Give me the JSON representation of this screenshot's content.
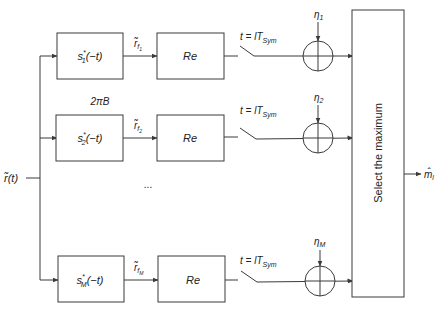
{
  "diagram": {
    "input": {
      "label": "r̃(t)"
    },
    "bandwidth_label": "2πB",
    "ellipsis": "...",
    "branches": [
      {
        "filter_label": "s₁*(−t)",
        "filter_base": "s",
        "filter_sub": "1",
        "signal_label": "r̃",
        "signal_sub": "f",
        "signal_subsub": "1",
        "real_label": "Re",
        "switch_label": "t = lT",
        "switch_sub": "Sym",
        "noise_label": "η",
        "noise_sub": "1"
      },
      {
        "filter_label": "s₂*(−t)",
        "filter_base": "s",
        "filter_sub": "2",
        "signal_label": "r̃",
        "signal_sub": "f",
        "signal_subsub": "2",
        "real_label": "Re",
        "switch_label": "t = lT",
        "switch_sub": "Sym",
        "noise_label": "η",
        "noise_sub": "2"
      },
      {
        "filter_label": "s_M*(−t)",
        "filter_base": "s",
        "filter_sub": "M",
        "signal_label": "r̃",
        "signal_sub": "f",
        "signal_subsub": "M",
        "real_label": "Re",
        "switch_label": "t = lT",
        "switch_sub": "Sym",
        "noise_label": "η",
        "noise_sub": "M"
      }
    ],
    "decision_block": {
      "label": "Select the maximum"
    },
    "output": {
      "label": "m̂",
      "sub": "l"
    },
    "colors": {
      "stroke": "#3a3a3a",
      "text": "#222222",
      "background": "#ffffff"
    }
  }
}
